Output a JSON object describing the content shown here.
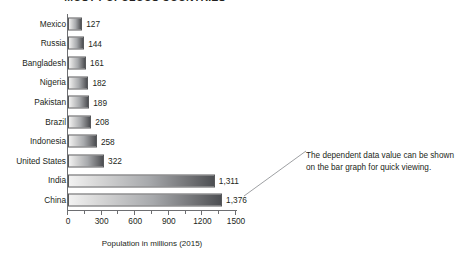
{
  "chart_data": {
    "type": "bar",
    "orientation": "horizontal",
    "title": "MOST POPULOUS COUNTRIES",
    "categories": [
      "Mexico",
      "Russia",
      "Bangladesh",
      "Nigeria",
      "Pakistan",
      "Brazil",
      "Indonesia",
      "United States",
      "India",
      "China"
    ],
    "values": [
      127,
      144,
      161,
      182,
      189,
      208,
      258,
      322,
      1311,
      1376
    ],
    "value_labels": [
      "127",
      "144",
      "161",
      "182",
      "189",
      "208",
      "258",
      "322",
      "1,311",
      "1,376"
    ],
    "xlabel": "Population in millions (2015)",
    "ylabel": "",
    "xlim": [
      0,
      1500
    ],
    "xticks": [
      0,
      300,
      600,
      900,
      1200,
      1500
    ],
    "xtick_labels": [
      "0",
      "300",
      "600",
      "900",
      "1200",
      "1500"
    ],
    "minor_tick_step": 150,
    "grid": false,
    "legend": null,
    "bar_fill": "gradient light-gray to dark-gray",
    "bar_border_color": "#58595b",
    "axis_color": "#6d6e71",
    "text_color": "#231f20"
  },
  "annotation": {
    "text": "The dependent data value can be shown on the bar graph for quick viewing.",
    "leader_line": "diagonal from bar value label to text block"
  }
}
